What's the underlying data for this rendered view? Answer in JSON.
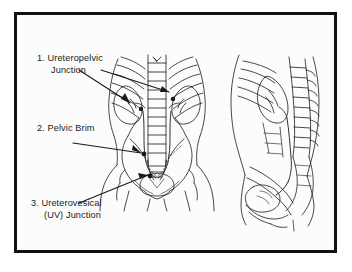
{
  "figure": {
    "background_color": "#fcfcfc",
    "frame_color": "#111111",
    "ink_color": "#1a1a1a"
  },
  "annotations": [
    {
      "id": "1",
      "name": "ureteropelvic-junction",
      "line_1": "1. Ureteropelvic",
      "line_2": "Junction"
    },
    {
      "id": "2",
      "name": "pelvic-brim",
      "line_1": "2. Pelvic Brim",
      "line_2": ""
    },
    {
      "id": "3",
      "name": "ureterovesical-junction",
      "line_1": "3. Ureterovesical",
      "line_2": "(UV) Junction"
    }
  ],
  "views": [
    {
      "name": "anterior-torso-view",
      "description": "Anterior view of torso showing ribs, vertebral column, kidneys, ureters, bony pelvis and bladder"
    },
    {
      "name": "lateral-sagittal-view",
      "description": "Lateral sagittal view showing spine, kidney, ureter and bladder"
    }
  ]
}
